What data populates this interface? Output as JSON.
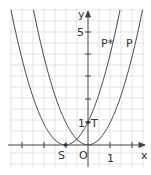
{
  "diagram": {
    "axes": {
      "x_label": "x",
      "y_label": "y",
      "origin_label": "O",
      "x_tick_label": "1",
      "y_tick_labels": [
        "1",
        "5"
      ]
    },
    "curves": [
      {
        "name": "P",
        "equation": "y = x^2",
        "vertex": [
          0,
          0
        ]
      },
      {
        "name": "P*",
        "equation": "y = (x+1)^2",
        "vertex": [
          -1,
          0
        ]
      }
    ],
    "points": [
      {
        "label": "S",
        "x": -1,
        "y": 0
      },
      {
        "label": "T",
        "x": 0,
        "y": 1
      }
    ],
    "colors": {
      "grid": "#d8d8d8",
      "axis": "#444444",
      "curve": "#555555"
    }
  }
}
